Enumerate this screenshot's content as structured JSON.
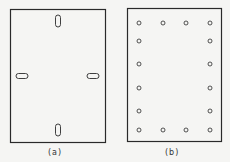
{
  "figure": {
    "panel_a": {
      "label": "(a)",
      "description": "Rectangular plate with four elongated slots at mid-sides"
    },
    "panel_b": {
      "label": "(b)",
      "description": "Rectangular plate with 16 circular holes around perimeter"
    },
    "colors": {
      "stroke": "#2a2a2a",
      "background": "#f5f5f3"
    }
  }
}
